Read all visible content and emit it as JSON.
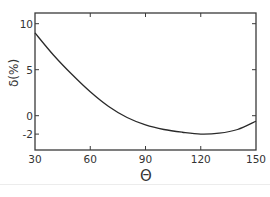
{
  "chart_data": {
    "type": "line",
    "title": "",
    "xlabel": "Θ",
    "ylabel": "δ(%)",
    "xlim": [
      30,
      150
    ],
    "ylim": [
      -3.8,
      11.1
    ],
    "x_ticks": [
      30,
      60,
      90,
      120,
      150
    ],
    "x_tick_labels": [
      "30",
      "60",
      "90",
      "120",
      "150"
    ],
    "y_ticks": [
      10,
      5,
      0,
      -2
    ],
    "y_tick_labels": [
      "10",
      "5",
      "0",
      "-2"
    ],
    "grid": false,
    "legend": null,
    "series": [
      {
        "name": "δ",
        "x": [
          30,
          40,
          50,
          60,
          70,
          80,
          90,
          100,
          110,
          120,
          130,
          140,
          150
        ],
        "values": [
          9.0,
          6.6,
          4.5,
          2.6,
          1.0,
          -0.2,
          -1.0,
          -1.5,
          -1.8,
          -2.0,
          -1.9,
          -1.5,
          -0.6
        ]
      }
    ],
    "line_color": "#2a2a2a"
  },
  "labels": {
    "xlabel": "Θ",
    "ylabel": "δ(%)"
  }
}
